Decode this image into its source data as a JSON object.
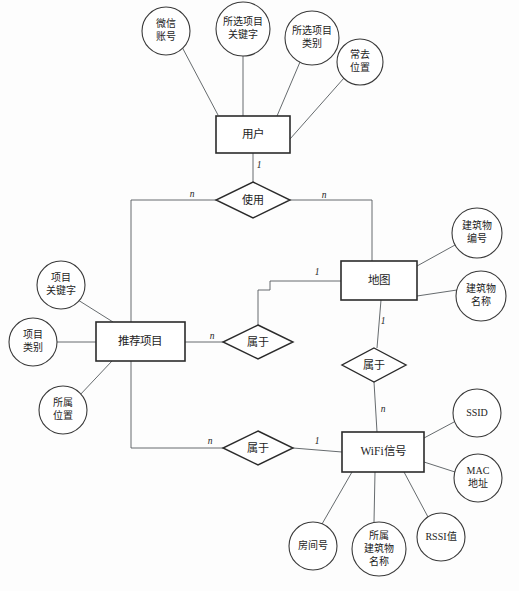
{
  "diagram": {
    "type": "entity-relationship",
    "entities": [
      {
        "id": "user",
        "label": "用户",
        "x": 216,
        "y": 116,
        "w": 74,
        "h": 37
      },
      {
        "id": "recommend_item",
        "label": "推荐项目",
        "x": 96,
        "y": 322,
        "w": 89,
        "h": 39
      },
      {
        "id": "map",
        "label": "地图",
        "x": 341,
        "y": 261,
        "w": 76,
        "h": 39
      },
      {
        "id": "wifi_signal",
        "label": "WiFi信号",
        "x": 342,
        "y": 432,
        "w": 82,
        "h": 40
      }
    ],
    "relationships": [
      {
        "id": "use",
        "label": "使用",
        "cx": 253,
        "cy": 200,
        "rx": 37,
        "ry": 18
      },
      {
        "id": "belong_item_map",
        "label": "属于",
        "cx": 258,
        "cy": 342,
        "rx": 35,
        "ry": 17
      },
      {
        "id": "belong_map_wifi",
        "label": "属于",
        "cx": 374,
        "cy": 365,
        "rx": 32,
        "ry": 17
      },
      {
        "id": "belong_item_wifi",
        "label": "属于",
        "cx": 258,
        "cy": 448,
        "rx": 35,
        "ry": 17
      }
    ],
    "attributes": [
      {
        "id": "wechat_account",
        "owner": "user",
        "lines": [
          "微信",
          "账号"
        ],
        "cx": 166,
        "cy": 31,
        "rx": 24,
        "ry": 24
      },
      {
        "id": "selected_item_keyword",
        "owner": "user",
        "lines": [
          "所选项目",
          "关键字"
        ],
        "cx": 243,
        "cy": 29,
        "rx": 27,
        "ry": 27
      },
      {
        "id": "selected_item_category",
        "owner": "user",
        "lines": [
          "所选项目",
          "类别"
        ],
        "cx": 312,
        "cy": 38,
        "rx": 27,
        "ry": 27
      },
      {
        "id": "frequent_location",
        "owner": "user",
        "lines": [
          "常去",
          "位置"
        ],
        "cx": 360,
        "cy": 62,
        "rx": 23,
        "ry": 23
      },
      {
        "id": "item_keyword",
        "owner": "recommend_item",
        "lines": [
          "项目",
          "关键字"
        ],
        "cx": 61,
        "cy": 285,
        "rx": 24,
        "ry": 24
      },
      {
        "id": "item_category",
        "owner": "recommend_item",
        "lines": [
          "项目",
          "类别"
        ],
        "cx": 33,
        "cy": 342,
        "rx": 24,
        "ry": 24
      },
      {
        "id": "item_location",
        "owner": "recommend_item",
        "lines": [
          "所属",
          "位置"
        ],
        "cx": 63,
        "cy": 410,
        "rx": 24,
        "ry": 24
      },
      {
        "id": "building_number",
        "owner": "map",
        "lines": [
          "建筑物",
          "编号"
        ],
        "cx": 477,
        "cy": 233,
        "rx": 25,
        "ry": 25
      },
      {
        "id": "building_name",
        "owner": "map",
        "lines": [
          "建筑物",
          "名称"
        ],
        "cx": 481,
        "cy": 296,
        "rx": 25,
        "ry": 25
      },
      {
        "id": "ssid",
        "owner": "wifi_signal",
        "lines": [
          "SSID"
        ],
        "cx": 477,
        "cy": 413,
        "rx": 24,
        "ry": 24
      },
      {
        "id": "mac_address",
        "owner": "wifi_signal",
        "lines": [
          "MAC",
          "地址"
        ],
        "cx": 478,
        "cy": 478,
        "rx": 24,
        "ry": 24
      },
      {
        "id": "rssi_value",
        "owner": "wifi_signal",
        "lines": [
          "RSSI值"
        ],
        "cx": 441,
        "cy": 537,
        "rx": 24,
        "ry": 24
      },
      {
        "id": "wifi_building_name",
        "owner": "wifi_signal",
        "lines": [
          "所属",
          "建筑物",
          "名称"
        ],
        "cx": 379,
        "cy": 549,
        "rx": 27,
        "ry": 27
      },
      {
        "id": "room_number",
        "owner": "wifi_signal",
        "lines": [
          "房间号"
        ],
        "cx": 313,
        "cy": 546,
        "rx": 24,
        "ry": 24
      }
    ],
    "cardinalities": [
      {
        "id": "user-use",
        "value": "1",
        "x": 259,
        "y": 166
      },
      {
        "id": "use-left-n",
        "value": "n",
        "x": 192,
        "y": 195
      },
      {
        "id": "use-right-n",
        "value": "n",
        "x": 324,
        "y": 196
      },
      {
        "id": "map-left-1",
        "value": "1",
        "x": 317,
        "y": 273
      },
      {
        "id": "item-belong-n",
        "value": "n",
        "x": 212,
        "y": 337
      },
      {
        "id": "map-down-1",
        "value": "1",
        "x": 383,
        "y": 322
      },
      {
        "id": "wifi-up-n",
        "value": "n",
        "x": 383,
        "y": 410
      },
      {
        "id": "item-wifi-n",
        "value": "n",
        "x": 210,
        "y": 442
      },
      {
        "id": "wifi-left-1",
        "value": "1",
        "x": 317,
        "y": 442
      }
    ],
    "colors": {
      "background": "#fdfdfd",
      "entity_stroke": "#2b2b2b",
      "relationship_stroke": "#2b2b2b",
      "attribute_stroke": "#3a3a3a",
      "edge_stroke": "#555a5e",
      "text": "#1d1d1d"
    }
  }
}
